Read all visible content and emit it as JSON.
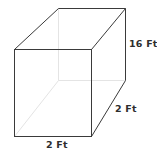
{
  "diagram": {
    "shape": "rectangular-prism",
    "labels": {
      "height": "16 Ft",
      "depth": "2 Ft",
      "width": "2 Ft"
    },
    "colors": {
      "visible_edge": "#3a3a3a",
      "hidden_edge": "#e4e4e4",
      "label_text": "#2e2e2e",
      "background": "#ffffff"
    },
    "vertices": {
      "front_top_left": [
        14,
        49
      ],
      "front_top_right": [
        91,
        49
      ],
      "front_bottom_right": [
        91,
        136
      ],
      "front_bottom_left": [
        14,
        136
      ],
      "back_top_left": [
        58,
        8
      ],
      "back_top_right": [
        125,
        8
      ],
      "back_bottom_right": [
        125,
        80
      ],
      "back_bottom_left": [
        58,
        80
      ]
    }
  }
}
